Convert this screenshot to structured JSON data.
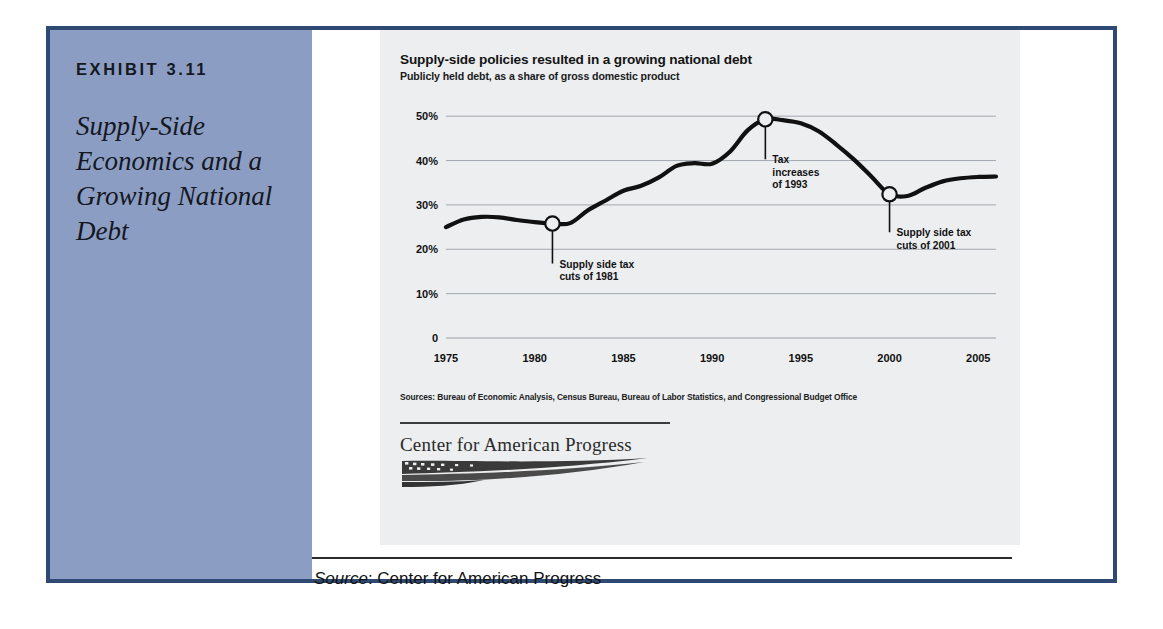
{
  "exhibit": {
    "label": "EXHIBIT 3.11",
    "title": "Supply-Side Economics and a Growing National Debt",
    "panel_color": "#8c9dc4",
    "frame_color": "#2e4a72"
  },
  "chart_card": {
    "background": "#eceef0",
    "sources": "Sources: Bureau of Economic Analysis, Census Bureau, Bureau of Labor Statistics, and Congressional Budget Office",
    "logo_wordmark": "Center for American Progress"
  },
  "source_note": {
    "prefix": "Source",
    "separator": ": ",
    "value": "Center for American Progress"
  },
  "chart_data": {
    "type": "line",
    "title": "Supply-side policies resulted in a growing national debt",
    "subtitle": "Publicly held debt, as a share of gross domestic product",
    "xlabel": "",
    "ylabel": "",
    "xlim": [
      1975,
      2006
    ],
    "ylim": [
      0,
      55
    ],
    "grid": true,
    "legend": "none",
    "line_color": "#111111",
    "xticks": [
      1975,
      1980,
      1985,
      1990,
      1995,
      2000,
      2005
    ],
    "xtick_labels": [
      "1975",
      "1980",
      "1985",
      "1990",
      "1995",
      "2000",
      "2005"
    ],
    "yticks": [
      0,
      10,
      20,
      30,
      40,
      50
    ],
    "ytick_labels": [
      "0",
      "10%",
      "20%",
      "30%",
      "40%",
      "50%"
    ],
    "series": [
      {
        "name": "Publicly held debt as share of GDP",
        "x": [
          1975,
          1976,
          1977,
          1978,
          1979,
          1980,
          1981,
          1982,
          1983,
          1984,
          1985,
          1986,
          1987,
          1988,
          1989,
          1990,
          1991,
          1992,
          1993,
          1994,
          1995,
          1996,
          1997,
          1998,
          1999,
          2000,
          2001,
          2002,
          2003,
          2004,
          2005,
          2006
        ],
        "y": [
          25.0,
          26.7,
          27.3,
          27.2,
          26.6,
          26.1,
          25.8,
          25.9,
          28.8,
          31.0,
          33.2,
          34.3,
          36.2,
          38.8,
          39.4,
          39.3,
          42.0,
          46.8,
          49.3,
          49.1,
          48.4,
          46.6,
          43.6,
          40.2,
          36.3,
          32.4,
          32.0,
          33.8,
          35.3,
          36.0,
          36.3,
          36.4
        ]
      }
    ],
    "annotations": [
      {
        "id": "anno-1981",
        "marker_x": 1981,
        "marker_y": 25.8,
        "lines": [
          "Supply side tax",
          "cuts of 1981"
        ]
      },
      {
        "id": "anno-1993",
        "marker_x": 1993,
        "marker_y": 49.3,
        "lines": [
          "Tax",
          "increases",
          "of 1993"
        ]
      },
      {
        "id": "anno-2001",
        "marker_x": 2000,
        "marker_y": 32.4,
        "lines": [
          "Supply side tax",
          "cuts of 2001"
        ]
      }
    ]
  }
}
